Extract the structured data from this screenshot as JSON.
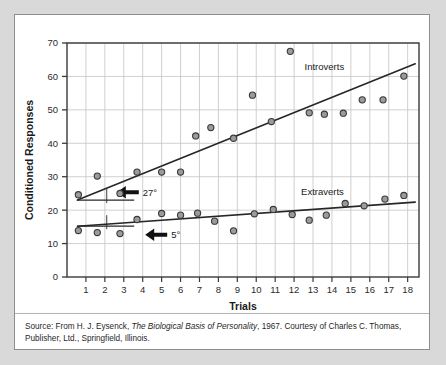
{
  "figure": {
    "background_color": "#d9d9d9",
    "panel_color": "#ffffff",
    "border_color": "#8d8d8d"
  },
  "caption": {
    "source_prefix": "Source: From H. J. Eysenck, ",
    "work_title": "The Biological Basis of Personality",
    "source_suffix": ", 1967. Courtesy of Charles C. Thomas, Publisher, Ltd., Springfield, Illinois."
  },
  "chart_data": {
    "type": "scatter",
    "title": "",
    "xlabel": "Trials",
    "ylabel": "Conditioned Responses",
    "xlim": [
      0,
      18.6
    ],
    "ylim": [
      0,
      70
    ],
    "xticks": [
      1,
      2,
      3,
      4,
      5,
      6,
      7,
      8,
      9,
      10,
      11,
      12,
      13,
      14,
      15,
      16,
      17,
      18
    ],
    "xtick_labels": [
      "1",
      "2",
      "3",
      "4",
      "5",
      "6",
      "7",
      "8",
      "9",
      "10",
      "11",
      "12",
      "13",
      "14",
      "15",
      "16",
      "17",
      "18"
    ],
    "yticks": [
      0,
      10,
      20,
      30,
      40,
      50,
      60,
      70
    ],
    "ytick_labels": [
      "0",
      "10",
      "20",
      "30",
      "40",
      "50",
      "60",
      "70"
    ],
    "grid": true,
    "grid_color": "#c4c4c4",
    "marker_fill": "#9b9b9b",
    "marker_edge": "#3a3a3a",
    "line_color": "#262626",
    "legend_position": "inline-annotations",
    "series": [
      {
        "name": "Introverts",
        "label_x": 13.6,
        "label_y": 62.0,
        "trendline": {
          "x0": 0.55,
          "y0": 23.0,
          "x1": 18.4,
          "y1": 63.8,
          "angle_label": "27°",
          "angle_label_x": 3.9,
          "angle_label_y": 25.0
        },
        "x": [
          0.6,
          1.6,
          2.8,
          3.7,
          5.0,
          6.0,
          6.8,
          7.6,
          8.8,
          9.8,
          10.8,
          11.8,
          12.8,
          13.6,
          14.6,
          15.6,
          16.7,
          17.8
        ],
        "y": [
          24.6,
          30.2,
          25.0,
          31.4,
          31.4,
          31.4,
          42.2,
          44.7,
          41.5,
          54.4,
          46.5,
          67.5,
          49.1,
          48.7,
          49.0,
          53.0,
          53.0,
          60.1
        ]
      },
      {
        "name": "Extraverts",
        "label_x": 13.5,
        "label_y": 24.6,
        "trendline": {
          "x0": 0.55,
          "y0": 15.2,
          "x1": 18.4,
          "y1": 22.4,
          "angle_label": "5°",
          "angle_label_x": 5.4,
          "angle_label_y": 12.3
        },
        "x": [
          0.6,
          1.6,
          2.8,
          3.7,
          5.0,
          6.0,
          6.9,
          7.8,
          8.8,
          9.9,
          10.9,
          11.9,
          12.8,
          13.7,
          14.7,
          15.7,
          16.8,
          17.8
        ],
        "y": [
          13.9,
          13.3,
          13.0,
          17.2,
          19.0,
          18.5,
          19.1,
          16.7,
          13.8,
          18.9,
          20.2,
          18.7,
          17.0,
          18.5,
          22.0,
          21.3,
          23.3,
          24.4
        ]
      }
    ],
    "annotations": [
      {
        "name": "introvert-angle",
        "text": "27°",
        "arrow": "left"
      },
      {
        "name": "extravert-angle",
        "text": "5°",
        "arrow": "left"
      }
    ]
  }
}
